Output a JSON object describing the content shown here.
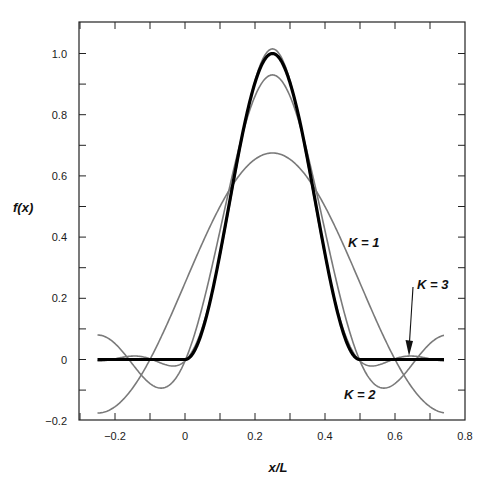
{
  "chart_data": {
    "type": "line",
    "title": "",
    "xlabel": "x/L",
    "ylabel": "f(x)",
    "xlim": [
      -0.31,
      0.8
    ],
    "ylim": [
      -0.2,
      1.1
    ],
    "grid": false,
    "legend": "none (inline annotations)",
    "x_ticks": [
      -0.2,
      0,
      0.2,
      0.4,
      0.6,
      0.8
    ],
    "x_tick_labels": [
      "−0.2",
      "0",
      "0.2",
      "0.4",
      "0.6",
      "0.8"
    ],
    "x_minor_ticks": [
      -0.3,
      -0.2,
      -0.1,
      0,
      0.1,
      0.2,
      0.3,
      0.4,
      0.5,
      0.6,
      0.7
    ],
    "y_ticks": [
      -0.2,
      0,
      0.2,
      0.4,
      0.6,
      0.8,
      1.0
    ],
    "y_tick_labels": [
      "−0.2",
      "0",
      "0.2",
      "0.4",
      "0.6",
      "0.8",
      "1.0"
    ],
    "y_minor_ticks": [
      -0.1,
      0.1,
      0.3,
      0.5,
      0.7,
      0.9
    ],
    "x_range_plotted": [
      -0.25,
      0.74
    ],
    "fourier": {
      "mean": 0.25,
      "center": 0.25,
      "coefficients": [
        0.425,
        0.255,
        0.085
      ]
    },
    "x": [
      -0.25,
      -0.2,
      -0.15,
      -0.1,
      -0.05,
      0,
      0.05,
      0.1,
      0.15,
      0.2,
      0.25,
      0.3,
      0.35,
      0.4,
      0.45,
      0.5,
      0.55,
      0.6,
      0.65,
      0.7,
      0.75
    ],
    "series": [
      {
        "name": "exact f(x)",
        "style": "thick-black",
        "values": [
          0,
          0,
          0,
          0,
          0,
          0,
          0.095,
          0.345,
          0.655,
          0.905,
          1.0,
          0.905,
          0.655,
          0.345,
          0.095,
          0,
          0,
          0,
          0,
          0,
          0
        ]
      },
      {
        "name": "K = 1",
        "style": "thin-gray",
        "values": [
          -0.175,
          -0.154,
          -0.094,
          0.0,
          0.119,
          0.25,
          0.381,
          0.5,
          0.594,
          0.654,
          0.675,
          0.654,
          0.594,
          0.5,
          0.381,
          0.25,
          0.119,
          0.0,
          -0.094,
          -0.154,
          -0.175
        ]
      },
      {
        "name": "K = 2",
        "style": "thin-gray",
        "values": [
          0.08,
          0.052,
          -0.015,
          -0.079,
          -0.087,
          -0.005,
          0.175,
          0.421,
          0.673,
          0.86,
          0.93,
          0.86,
          0.673,
          0.421,
          0.175,
          -0.005,
          -0.087,
          -0.079,
          -0.015,
          0.052,
          0.08
        ]
      },
      {
        "name": "K = 3",
        "style": "thin-gray",
        "values": [
          -0.005,
          0.002,
          0.011,
          0.002,
          -0.018,
          -0.005,
          0.106,
          0.34,
          0.647,
          0.91,
          1.015,
          0.91,
          0.647,
          0.34,
          0.106,
          -0.005,
          -0.018,
          0.002,
          0.011,
          0.002,
          -0.005
        ]
      }
    ],
    "annotations": [
      {
        "text": "K = 1",
        "x": 0.47,
        "y": 0.38
      },
      {
        "text": "K = 2",
        "x": 0.49,
        "y": -0.115
      },
      {
        "text": "K = 3",
        "x": 0.67,
        "y": 0.245,
        "arrow_to": [
          0.64,
          0.01
        ]
      }
    ]
  },
  "labels": {
    "ylabel": "f(x)",
    "xlabel": "x/L",
    "k1": "K = 1",
    "k2": "K = 2",
    "k3": "K = 3"
  },
  "colors": {
    "exact": "#000000",
    "approx": "#7a7a7a",
    "frame": "#222222"
  }
}
